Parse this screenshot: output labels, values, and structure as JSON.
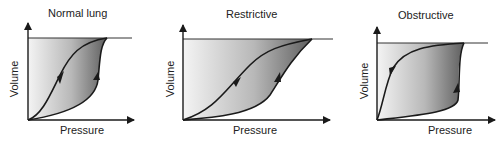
{
  "figure": {
    "panels": [
      {
        "title": "Normal lung",
        "xlabel": "Pressure",
        "ylabel": "Volume"
      },
      {
        "title": "Restrictive",
        "xlabel": "Pressure",
        "ylabel": "Volume"
      },
      {
        "title": "Obstructive",
        "xlabel": "Pressure",
        "ylabel": "Volume"
      }
    ]
  },
  "colors": {
    "line": "#1a1a1a",
    "fill_light": "#f2f2f2",
    "fill_dark": "#6e6e6e"
  }
}
